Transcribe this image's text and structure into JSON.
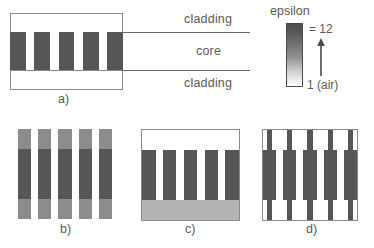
{
  "figure": {
    "type": "photonic-crystal-waveguide-schematic",
    "panels": [
      "a)",
      "b)",
      "c)",
      "d)"
    ]
  },
  "panel_a": {
    "letter": "a)",
    "labels": {
      "cladding_top": "cladding",
      "core": "core",
      "cladding_bottom": "cladding"
    },
    "structure": {
      "cladding_fill": "#ffffff",
      "core_background": "#ffffff",
      "rod_color": "#565656",
      "rod_count": 4,
      "rod_positions_pct": [
        0,
        21.5,
        43,
        64.5,
        86
      ],
      "rod_width_pct": 14
    }
  },
  "legend": {
    "title": "epsilon",
    "max_label": "= 12",
    "min_label": "1 (air)",
    "gradient_top_color": "#4f4f4f",
    "gradient_bottom_color": "#ffffff",
    "arrow_direction": "up"
  },
  "panel_b": {
    "letter": "b)",
    "description": "uniform rods, cladding rods lighter than core rods",
    "cladding_rod_color": "#8c8c8c",
    "core_rod_color": "#565656",
    "gap_color": "#ffffff",
    "core_band_top_pct": 22,
    "core_band_height_pct": 56,
    "rod_count": 4,
    "rod_positions_pct": [
      0,
      21.5,
      43,
      64.5,
      86
    ],
    "rod_width_pct": 14
  },
  "panel_c": {
    "letter": "c)",
    "description": "rods on light substrate with air top cladding",
    "top_band_color": "#ffffff",
    "bottom_band_color": "#b4b4b4",
    "rod_color": "#565656",
    "top_band_height_pct": 22,
    "bottom_band_height_pct": 22,
    "rod_count": 4,
    "rod_positions_pct": [
      0,
      21.5,
      43,
      64.5,
      86
    ],
    "rod_width_pct": 14
  },
  "panel_d": {
    "letter": "d)",
    "description": "thin rods widening inside the core region",
    "rod_color": "#565656",
    "background_color": "#ffffff",
    "core_band_top_pct": 22,
    "core_band_height_pct": 56,
    "rod_count": 4,
    "thin_width_pct": 5.5,
    "wide_width_pct": 14,
    "rod_centers_pct": [
      7,
      28.5,
      50,
      71.5,
      93
    ]
  },
  "colors": {
    "outline": "#8a8a8a",
    "rule": "#6a6a6a",
    "text": "#5a5a5a",
    "dark_rod": "#565656",
    "mid_rod": "#8c8c8c",
    "light_substrate": "#b4b4b4"
  }
}
